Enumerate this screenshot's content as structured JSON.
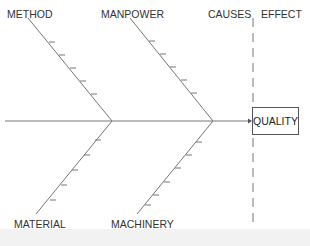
{
  "diagram": {
    "type": "fishbone",
    "header": {
      "causes_label": "CAUSES",
      "effect_label": "EFFECT"
    },
    "effect": "QUALITY",
    "categories": [
      {
        "label": "METHOD",
        "position": "top",
        "ticks": 5
      },
      {
        "label": "MANPOWER",
        "position": "top",
        "ticks": 5
      },
      {
        "label": "MATERIAL",
        "position": "bottom",
        "ticks": 5
      },
      {
        "label": "MACHINERY",
        "position": "bottom",
        "ticks": 5
      }
    ],
    "colors": {
      "line": "#777777",
      "text": "#333333",
      "background": "#ffffff"
    }
  }
}
